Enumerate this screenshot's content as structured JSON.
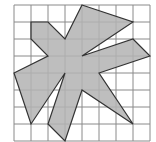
{
  "diagram": {
    "type": "grid-polygon",
    "grid": {
      "columns": 8,
      "rows": 8,
      "origin_px": [
        14,
        5
      ],
      "cell_px": 17,
      "line_color": "#8a8a8a",
      "background": "#ffffff"
    },
    "polygon": {
      "fill": "#b3b3b3",
      "stroke": "#333333",
      "vertices": [
        [
          4,
          0
        ],
        [
          7,
          1
        ],
        [
          4,
          3
        ],
        [
          7,
          2
        ],
        [
          8,
          3
        ],
        [
          5,
          4
        ],
        [
          7,
          7
        ],
        [
          4,
          5
        ],
        [
          3,
          8
        ],
        [
          2,
          7
        ],
        [
          3,
          4
        ],
        [
          1,
          7
        ],
        [
          0,
          4
        ],
        [
          2,
          3
        ],
        [
          1,
          2
        ],
        [
          1,
          1
        ],
        [
          2,
          1
        ],
        [
          3,
          2
        ]
      ]
    }
  }
}
